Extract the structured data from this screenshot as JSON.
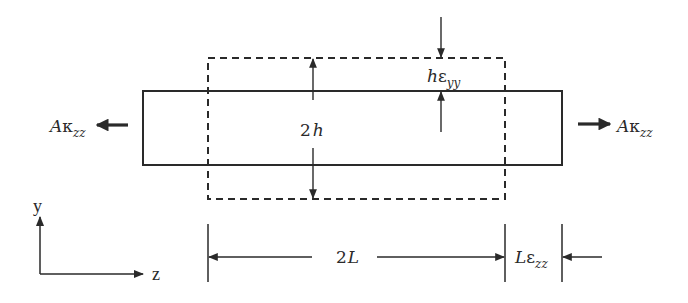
{
  "diagram": {
    "colors": {
      "stroke": "#2a2a2a",
      "background": "#ffffff"
    },
    "original_body": {
      "shape": "rectangle",
      "style": "solid",
      "x": 143,
      "y": 91,
      "width": 419,
      "height": 74
    },
    "deformed_body": {
      "shape": "rectangle",
      "style": "dashed",
      "x": 208,
      "y": 58,
      "width": 297,
      "height": 141
    },
    "labels": {
      "height_label": {
        "main": "2",
        "var": "h"
      },
      "transverse_strain": {
        "var": "h",
        "greek": "ε",
        "sub": "yy"
      },
      "force_left": {
        "var": "A",
        "greek": "κ",
        "sub": "zz"
      },
      "force_right": {
        "var": "A",
        "greek": "κ",
        "sub": "zz"
      },
      "length_label": {
        "main": "2",
        "var": "L"
      },
      "axial_strain": {
        "var": "L",
        "greek": "ε",
        "sub": "zz"
      }
    },
    "axes": {
      "vertical": "y",
      "horizontal": "z"
    }
  }
}
